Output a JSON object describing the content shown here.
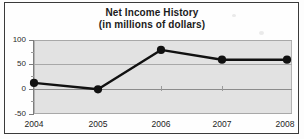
{
  "chart_data": {
    "type": "line",
    "title": "Net Income History",
    "subtitle": "(in millions of dollars)",
    "xlabel": "",
    "ylabel": "",
    "categories": [
      "2004",
      "2005",
      "2006",
      "2007",
      "2008"
    ],
    "values": [
      13,
      0,
      80,
      60,
      60
    ],
    "series": [
      {
        "name": "Net Income",
        "values": [
          13,
          0,
          80,
          60,
          60
        ]
      }
    ],
    "ylim": [
      -50,
      100
    ],
    "ytick_labels": [
      "100",
      "50",
      "0",
      "-50"
    ],
    "ytick_values": [
      100,
      50,
      0,
      -50
    ],
    "grid": true,
    "legend": "none",
    "marker": "filled-circle",
    "line_color": "#111111",
    "plot_background": "#e2e2e2",
    "gridline_color": "#a8a8a8"
  },
  "axes": {
    "y_labels": [
      {
        "text": "100",
        "value": 100
      },
      {
        "text": "50",
        "value": 50
      },
      {
        "text": "0",
        "value": 0
      },
      {
        "text": "-50",
        "value": -50
      }
    ],
    "x_labels": [
      {
        "text": "2004",
        "value": 2004
      },
      {
        "text": "2005",
        "value": 2005
      },
      {
        "text": "2006",
        "value": 2006
      },
      {
        "text": "2007",
        "value": 2007
      },
      {
        "text": "2008",
        "value": 2008
      }
    ]
  },
  "colors": {
    "frame": "#3a3a3a",
    "plot_bg": "#e2e2e2",
    "grid": "#a8a8a8",
    "series": "#111111",
    "text": "#1b1b1b",
    "page_bg": "#fdfdfd"
  }
}
